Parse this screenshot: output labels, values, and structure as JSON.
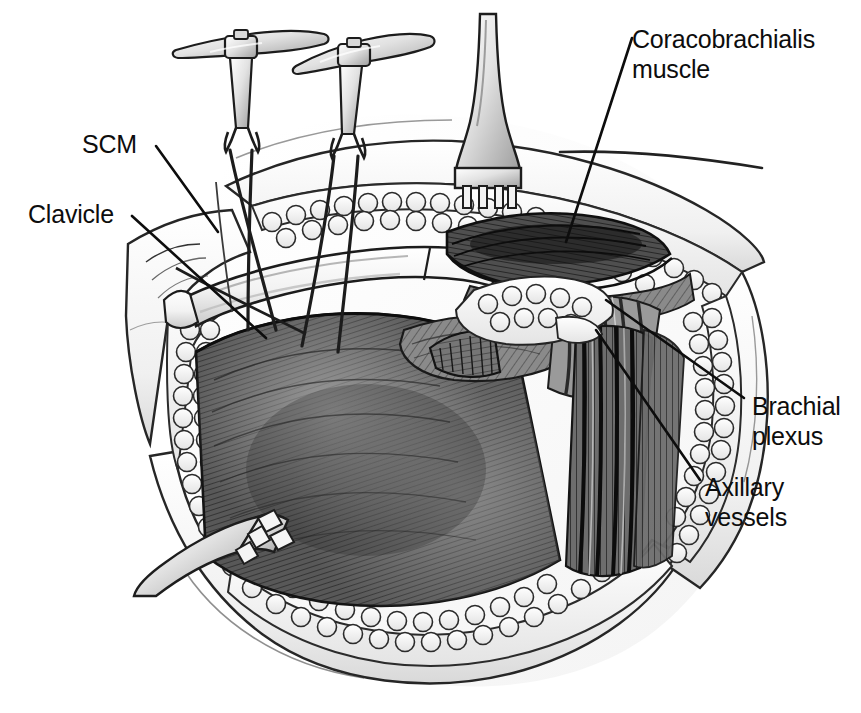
{
  "figure": {
    "background_color": "#ffffff",
    "ink_color": "#1a1a1a"
  },
  "labels": [
    {
      "id": "scm",
      "text": "SCM",
      "target": "sternocleidomastoid-muscle"
    },
    {
      "id": "clavicle",
      "text": "Clavicle",
      "target": "clavicle-bone"
    },
    {
      "id": "coracobrachialis",
      "text": "Coracobrachialis\nmuscle",
      "target": "coracobrachialis-muscle"
    },
    {
      "id": "brachial_plexus",
      "text": "Brachial\nplexus",
      "target": "brachial-plexus-cords"
    },
    {
      "id": "axillary_vessels",
      "text": "Axillary\nvessels",
      "target": "axillary-artery-and-vein"
    }
  ],
  "instruments": [
    {
      "name": "double-hook-retractor-left",
      "type": "T-handled double skin hook"
    },
    {
      "name": "double-hook-retractor-right",
      "type": "T-handled double skin hook"
    },
    {
      "name": "rake-retractor-superior",
      "type": "four-prong rake retractor"
    },
    {
      "name": "rake-retractor-inferior",
      "type": "four-prong rake retractor"
    }
  ],
  "anatomy": [
    {
      "name": "skin-flap-superior",
      "shading": "light"
    },
    {
      "name": "skin-flap-inferior",
      "shading": "light"
    },
    {
      "name": "subcutaneous-fat-lobules",
      "shading": "white lobulated"
    },
    {
      "name": "clavicle-bone",
      "shading": "white band"
    },
    {
      "name": "pectoralis-major-muscle",
      "shading": "dark striated"
    },
    {
      "name": "pectoralis-minor-muscle",
      "shading": "mid striated"
    },
    {
      "name": "coracobrachialis-muscle",
      "shading": "dark striated"
    },
    {
      "name": "brachial-plexus-cords",
      "shading": "mid grey bundles"
    },
    {
      "name": "axillary-vessels",
      "shading": "dark longitudinal bundles"
    }
  ],
  "palette": {
    "ink": "#1a1a1a",
    "muscle_dark": "#4a4a4a",
    "muscle_mid": "#7a7a7a",
    "muscle_light": "#a6a6a6",
    "fat": "#f4f4f4",
    "skin": "#e9e9e9",
    "bone": "#fbfbfb"
  }
}
